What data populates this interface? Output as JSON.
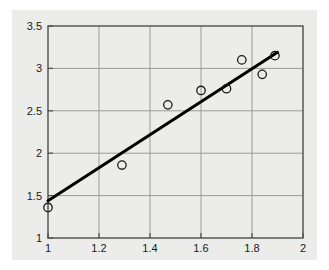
{
  "chart_data": {
    "type": "scatter",
    "title": "",
    "subtitle": "",
    "xlabel": "",
    "ylabel": "",
    "xlim": [
      1,
      2
    ],
    "ylim": [
      1,
      3.5
    ],
    "grid": true,
    "legend": null,
    "x_ticks": [
      1,
      1.2,
      1.4,
      1.6,
      1.8,
      2
    ],
    "x_tick_labels": [
      "1",
      "1.2",
      "1.4",
      "1.6",
      "1.8",
      "2"
    ],
    "y_ticks": [
      1,
      1.5,
      2,
      2.5,
      3,
      3.5
    ],
    "y_tick_labels": [
      "1",
      "1.5",
      "2",
      "2.5",
      "3",
      "3.5"
    ],
    "series": [
      {
        "name": "observations",
        "type": "scatter",
        "marker": "open-circle",
        "marker_color": "#1a1a1a",
        "marker_fill": "none",
        "x": [
          1.0,
          1.29,
          1.47,
          1.6,
          1.7,
          1.76,
          1.84,
          1.89
        ],
        "y": [
          1.36,
          1.86,
          2.57,
          2.74,
          2.76,
          3.1,
          2.93,
          3.15
        ]
      },
      {
        "name": "fit-line",
        "type": "line",
        "line_color": "#000000",
        "line_width": 3,
        "x": [
          1.0,
          1.9
        ],
        "y": [
          1.44,
          3.19
        ]
      }
    ],
    "colors": {
      "panel_background": "#ececeb",
      "figure_background": "#ffffff",
      "axis": "#4d4d4d",
      "grid": "#9a9a9a",
      "marker": "#1a1a1a",
      "line": "#000000",
      "tick_text": "#1a1a1a"
    }
  }
}
